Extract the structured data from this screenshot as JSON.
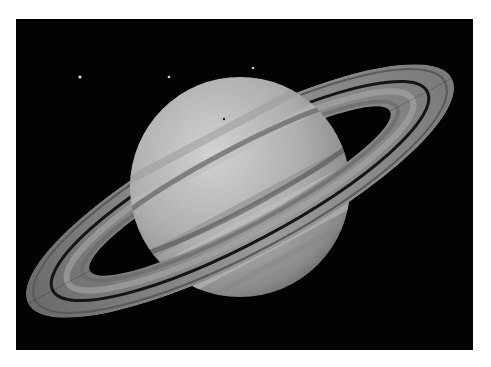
{
  "image": {
    "subject": "Saturn with rings",
    "background_color": "#ffffff",
    "sky_color": "#030303",
    "frame": {
      "x": 16,
      "y": 19,
      "width": 457,
      "height": 331
    }
  },
  "planet": {
    "name": "Saturn",
    "center": {
      "x": 224,
      "y": 168
    },
    "radius": 110,
    "base_color": "#a9a9a9",
    "highlight_color": "#cfcfcf",
    "shadow_color": "#6e6e6e"
  },
  "rings": {
    "tilt_deg": -28,
    "outer_rx": 240,
    "outer_ry": 66,
    "inner_rx": 170,
    "inner_ry": 32,
    "gap_rx": 212,
    "gap_ry": 52,
    "ring_color": "#8e8e8e",
    "gap_color": "#151515"
  },
  "moons": [
    {
      "x": 64,
      "y": 58,
      "r": 1.6
    },
    {
      "x": 153,
      "y": 58,
      "r": 1.3
    },
    {
      "x": 237,
      "y": 49,
      "r": 1.3
    }
  ],
  "shadow_dot": {
    "x": 208,
    "y": 100,
    "r": 1.2
  }
}
